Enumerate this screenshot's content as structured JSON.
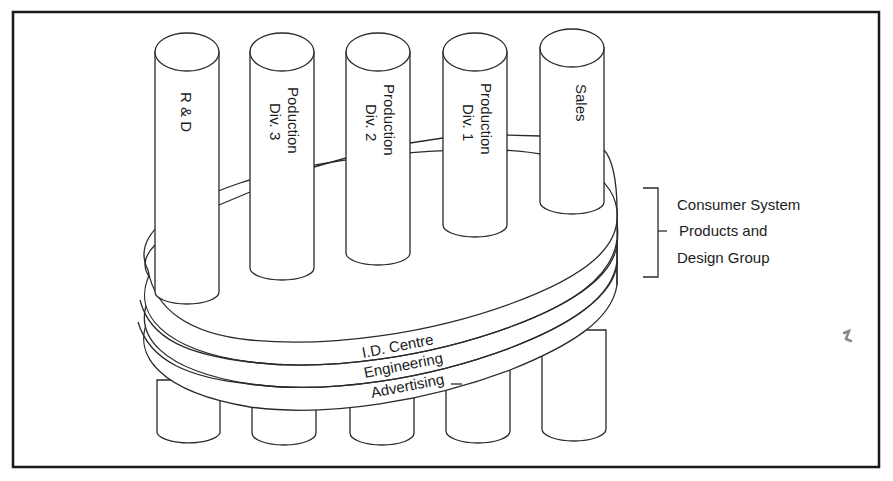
{
  "diagram": {
    "type": "organizational-structure",
    "pillars": [
      {
        "id": "rd",
        "lines": [
          "R & D"
        ]
      },
      {
        "id": "div3",
        "lines": [
          "Poduction",
          "Div. 3"
        ]
      },
      {
        "id": "div2",
        "lines": [
          "Production",
          "Div. 2"
        ]
      },
      {
        "id": "div1",
        "lines": [
          "Production",
          "Div. 1"
        ]
      },
      {
        "id": "sales",
        "lines": [
          "Sales"
        ]
      }
    ],
    "rings": [
      {
        "id": "id-centre",
        "label": "I.D. Centre"
      },
      {
        "id": "engineering",
        "label": "Engineering"
      },
      {
        "id": "advertising",
        "label": "Advertising"
      }
    ],
    "group_label": {
      "lines": [
        "Consumer System",
        "Products and",
        "Design Group"
      ]
    }
  }
}
